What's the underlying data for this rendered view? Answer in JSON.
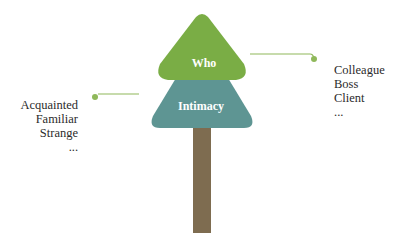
{
  "diagram": {
    "type": "tree-metaphor",
    "colors": {
      "top_layer": "#7aad45",
      "middle_layer": "#5e9593",
      "trunk": "#7e6c50",
      "connector": "#8fb85a"
    },
    "nodes": {
      "top": {
        "label": "Who"
      },
      "middle": {
        "label": "Intimacy"
      }
    },
    "right_list": {
      "connected_to": "Who",
      "items": [
        "Colleague",
        "Boss",
        "Client",
        "..."
      ]
    },
    "left_list": {
      "connected_to": "Intimacy",
      "items": [
        "Acquainted",
        "Familiar",
        "Strange",
        "..."
      ]
    }
  }
}
